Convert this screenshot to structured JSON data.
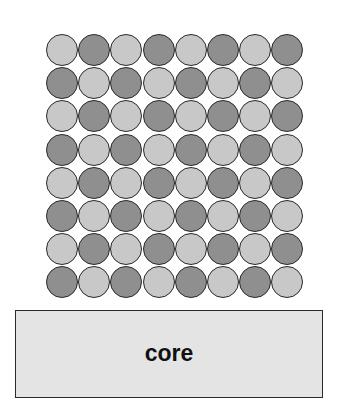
{
  "diagram": {
    "grid": {
      "rows": 8,
      "cols": 8,
      "pattern": "checkerboard",
      "first_cell": "light",
      "colors": {
        "light": "#c8c8c8",
        "dark": "#8f8f8f",
        "outline": "#2a2a2a"
      }
    },
    "core": {
      "label": "core",
      "fill": "#e4e4e4"
    }
  }
}
